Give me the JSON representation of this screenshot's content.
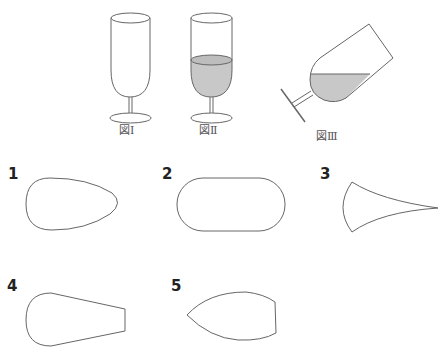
{
  "figures": [
    {
      "id": "fig1",
      "label": "図Ⅰ",
      "description": "empty upright glass"
    },
    {
      "id": "fig2",
      "label": "図Ⅱ",
      "description": "upright glass partially filled with liquid"
    },
    {
      "id": "fig3",
      "label": "図Ⅲ",
      "description": "tilted glass with liquid"
    }
  ],
  "options": [
    {
      "number": "1",
      "shape": "egg-shaped oval"
    },
    {
      "number": "2",
      "shape": "stadium / rounded rectangle"
    },
    {
      "number": "3",
      "shape": "concave wedge tapering to a point"
    },
    {
      "number": "4",
      "shape": "round end tapering to flat end"
    },
    {
      "number": "5",
      "shape": "pointed left end with flat right end"
    }
  ],
  "colors": {
    "stroke": "#666666",
    "liquid": "#c8c8c8"
  }
}
